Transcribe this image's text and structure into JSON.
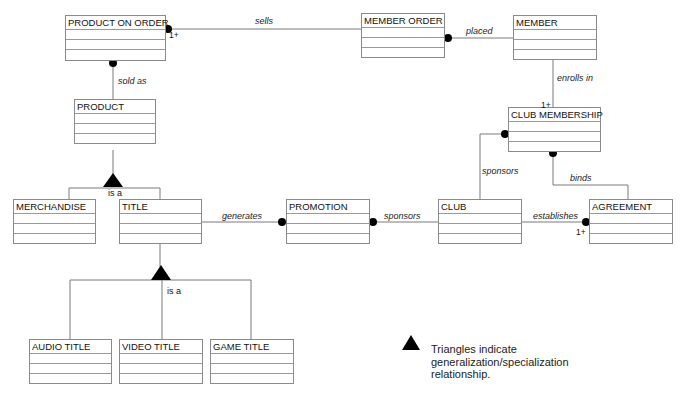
{
  "entities": {
    "product_on_order": "PRODUCT ON ORDER",
    "member_order": "MEMBER ORDER",
    "member": "MEMBER",
    "product": "PRODUCT",
    "club_membership": "CLUB MEMBERSHIP",
    "merchandise": "MERCHANDISE",
    "title": "TITLE",
    "promotion": "PROMOTION",
    "club": "CLUB",
    "agreement": "AGREEMENT",
    "audio_title": "AUDIO TITLE",
    "video_title": "VIDEO TITLE",
    "game_title": "GAME TITLE"
  },
  "relationships": {
    "sells": "sells",
    "placed": "placed",
    "sold_as": "sold as",
    "enrolls_in": "enrolls in",
    "sponsors_club_membership": "sponsors",
    "binds": "binds",
    "generates": "generates",
    "sponsors_promotion": "sponsors",
    "establishes": "establishes"
  },
  "multiplicities": {
    "sells_end": "1+",
    "enrolls_in_end": "1+",
    "establishes_end": "1+"
  },
  "generalizations": {
    "product_isa": "is a",
    "title_isa": "is a"
  },
  "legend": {
    "text": "Triangles indicate generalization/specialization relationship."
  }
}
